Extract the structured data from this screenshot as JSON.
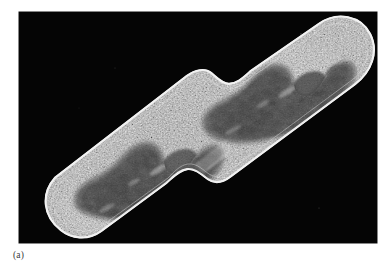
{
  "figure": {
    "caption_label": "(a)",
    "modality": "transmission electron micrograph",
    "plate": {
      "background_color": "#050505",
      "left": 19,
      "top": 12,
      "width": 358,
      "height": 231
    },
    "page_background_color": "#ffffff",
    "caption_color": "#3a3a3a"
  },
  "specimen": {
    "name": "bacterium-dividing",
    "orientation_degrees": -31,
    "cell_body_color": "#b9b9b9",
    "cell_wall_rim_color": "#efefef",
    "nucleoid_color": "#4a4a4a",
    "cytoplasm_granule_color": "#8d8d8d",
    "structures": [
      {
        "name": "daughter-cell-left",
        "label": "left daughter cell"
      },
      {
        "name": "daughter-cell-right",
        "label": "right daughter cell"
      },
      {
        "name": "septum-constriction",
        "label": "division septum / constriction"
      },
      {
        "name": "nucleoid-left",
        "label": "left nucleoid (DNA region)"
      },
      {
        "name": "nucleoid-right",
        "label": "right nucleoid (DNA region)"
      },
      {
        "name": "cell-envelope",
        "label": "cell wall and membrane"
      }
    ]
  }
}
